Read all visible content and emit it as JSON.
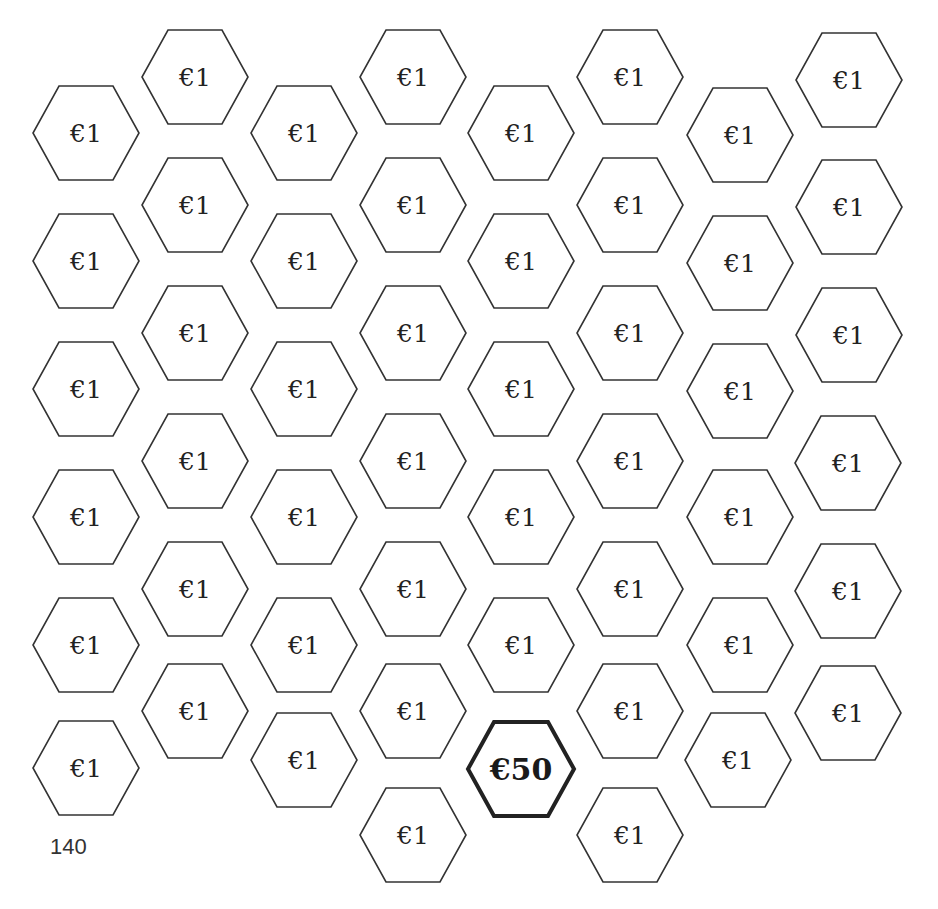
{
  "page": {
    "number": "140",
    "stroke_color": "#333333",
    "highlight_stroke_color": "#222222"
  },
  "hex_size": {
    "width": 108,
    "height": 96
  },
  "tiles": [
    {
      "label": "€1",
      "cx": 86,
      "cy": 133
    },
    {
      "label": "€1",
      "cx": 86,
      "cy": 261
    },
    {
      "label": "€1",
      "cx": 86,
      "cy": 389
    },
    {
      "label": "€1",
      "cx": 86,
      "cy": 517
    },
    {
      "label": "€1",
      "cx": 86,
      "cy": 645
    },
    {
      "label": "€1",
      "cx": 86,
      "cy": 768
    },
    {
      "label": "€1",
      "cx": 195,
      "cy": 77
    },
    {
      "label": "€1",
      "cx": 195,
      "cy": 205
    },
    {
      "label": "€1",
      "cx": 195,
      "cy": 333
    },
    {
      "label": "€1",
      "cx": 195,
      "cy": 461
    },
    {
      "label": "€1",
      "cx": 195,
      "cy": 589
    },
    {
      "label": "€1",
      "cx": 195,
      "cy": 711
    },
    {
      "label": "€1",
      "cx": 304,
      "cy": 133
    },
    {
      "label": "€1",
      "cx": 304,
      "cy": 261
    },
    {
      "label": "€1",
      "cx": 304,
      "cy": 389
    },
    {
      "label": "€1",
      "cx": 304,
      "cy": 517
    },
    {
      "label": "€1",
      "cx": 304,
      "cy": 645
    },
    {
      "label": "€1",
      "cx": 304,
      "cy": 760
    },
    {
      "label": "€1",
      "cx": 413,
      "cy": 77
    },
    {
      "label": "€1",
      "cx": 413,
      "cy": 205
    },
    {
      "label": "€1",
      "cx": 413,
      "cy": 333
    },
    {
      "label": "€1",
      "cx": 413,
      "cy": 461
    },
    {
      "label": "€1",
      "cx": 413,
      "cy": 589
    },
    {
      "label": "€1",
      "cx": 413,
      "cy": 711
    },
    {
      "label": "€1",
      "cx": 413,
      "cy": 835
    },
    {
      "label": "€1",
      "cx": 521,
      "cy": 133
    },
    {
      "label": "€1",
      "cx": 521,
      "cy": 261
    },
    {
      "label": "€1",
      "cx": 521,
      "cy": 389
    },
    {
      "label": "€1",
      "cx": 521,
      "cy": 517
    },
    {
      "label": "€1",
      "cx": 521,
      "cy": 645
    },
    {
      "label": "€50",
      "cx": 521,
      "cy": 769,
      "highlight": true
    },
    {
      "label": "€1",
      "cx": 630,
      "cy": 77
    },
    {
      "label": "€1",
      "cx": 630,
      "cy": 205
    },
    {
      "label": "€1",
      "cx": 630,
      "cy": 333
    },
    {
      "label": "€1",
      "cx": 630,
      "cy": 461
    },
    {
      "label": "€1",
      "cx": 630,
      "cy": 589
    },
    {
      "label": "€1",
      "cx": 630,
      "cy": 711
    },
    {
      "label": "€1",
      "cx": 630,
      "cy": 835
    },
    {
      "label": "€1",
      "cx": 740,
      "cy": 135
    },
    {
      "label": "€1",
      "cx": 740,
      "cy": 263
    },
    {
      "label": "€1",
      "cx": 740,
      "cy": 391
    },
    {
      "label": "€1",
      "cx": 740,
      "cy": 517
    },
    {
      "label": "€1",
      "cx": 740,
      "cy": 645
    },
    {
      "label": "€1",
      "cx": 738,
      "cy": 760
    },
    {
      "label": "€1",
      "cx": 849,
      "cy": 80
    },
    {
      "label": "€1",
      "cx": 849,
      "cy": 207
    },
    {
      "label": "€1",
      "cx": 849,
      "cy": 335
    },
    {
      "label": "€1",
      "cx": 848,
      "cy": 463
    },
    {
      "label": "€1",
      "cx": 848,
      "cy": 591
    },
    {
      "label": "€1",
      "cx": 848,
      "cy": 713
    }
  ]
}
